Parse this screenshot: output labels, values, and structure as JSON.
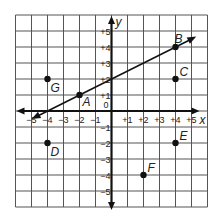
{
  "diagram": {
    "type": "coordinate-plane",
    "axes": {
      "x_label": "x",
      "y_label": "y",
      "x_ticks": [
        "−5",
        "−4",
        "−3",
        "−2",
        "−1",
        "+1",
        "+2",
        "+3",
        "+4",
        "+5"
      ],
      "y_ticks": [
        "+5",
        "+4",
        "+3",
        "+2",
        "+1",
        "−1",
        "−2",
        "−3",
        "−4",
        "−5"
      ],
      "origin_label": "0",
      "grid_range": [
        -6,
        6
      ]
    },
    "points": [
      {
        "label": "A",
        "x": -2,
        "y": 1
      },
      {
        "label": "B",
        "x": 4,
        "y": 4
      },
      {
        "label": "C",
        "x": 4,
        "y": 2
      },
      {
        "label": "D",
        "x": -4,
        "y": -2
      },
      {
        "label": "E",
        "x": 4,
        "y": -2
      },
      {
        "label": "F",
        "x": 2,
        "y": -4
      },
      {
        "label": "G",
        "x": -4,
        "y": 2
      }
    ],
    "line": {
      "through": [
        "A",
        "B"
      ],
      "equation": "y = 0.5x + 2",
      "from": [
        -5,
        -0.5
      ],
      "to": [
        5.3,
        4.65
      ]
    },
    "colors": {
      "grid": "#555555",
      "axis": "#111111",
      "ink": "#111111"
    }
  }
}
